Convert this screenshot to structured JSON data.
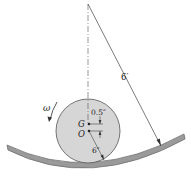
{
  "diagram": {
    "labels": {
      "radius_track": "6′",
      "offset": "0.5″",
      "disk_radius": "6″",
      "G": "G",
      "O": "O",
      "omega": "ω"
    },
    "colors": {
      "disk_fill": "#d6d6d6",
      "track_fill": "#9a9a9a",
      "track_edge": "#6e6e6e",
      "line": "#333333"
    }
  }
}
